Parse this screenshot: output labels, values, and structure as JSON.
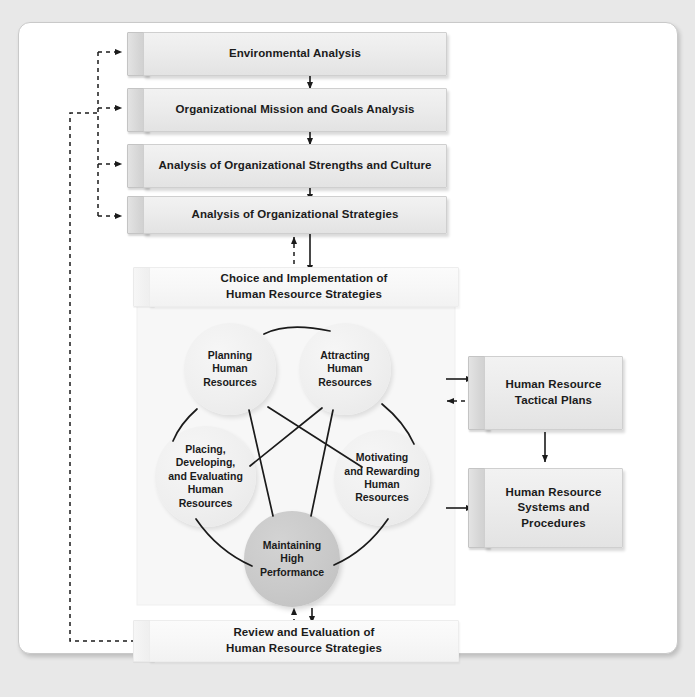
{
  "diagram": {
    "colors": {
      "page_background": "#e8e8e8",
      "canvas_background": "#ffffff",
      "box_face": "#ececec",
      "box_tab": "#d4d4d4",
      "panel_background": "#f7f7f7",
      "circle_light": "#efefef",
      "circle_dark": "#c9c9c9",
      "line": "#1b1b1b",
      "text": "#1b1b1b"
    }
  },
  "process_steps": [
    {
      "id": "environmental-analysis",
      "label": "Environmental Analysis"
    },
    {
      "id": "mission-goals-analysis",
      "label": "Organizational Mission and Goals Analysis"
    },
    {
      "id": "strengths-culture-analysis",
      "label": "Analysis of Organizational Strengths and Culture"
    },
    {
      "id": "strategies-analysis",
      "label": "Analysis of Organizational Strategies"
    }
  ],
  "choice_box": {
    "id": "choice-implementation",
    "line1": "Choice and Implementation of",
    "line2": "Human Resource Strategies"
  },
  "review_box": {
    "id": "review-evaluation",
    "line1": "Review and Evaluation of",
    "line2": "Human Resource Strategies"
  },
  "circles": [
    {
      "id": "planning-human-resources",
      "style": "light",
      "lines": [
        "Planning",
        "Human",
        "Resources"
      ]
    },
    {
      "id": "attracting-human-resources",
      "style": "light",
      "lines": [
        "Attracting",
        "Human",
        "Resources"
      ]
    },
    {
      "id": "placing-developing-evaluating-human-resources",
      "style": "light",
      "lines": [
        "Placing,",
        "Developing,",
        "and Evaluating",
        "Human",
        "Resources"
      ]
    },
    {
      "id": "motivating-rewarding-human-resources",
      "style": "light",
      "lines": [
        "Motivating",
        "and Rewarding",
        "Human",
        "Resources"
      ]
    },
    {
      "id": "maintaining-high-performance",
      "style": "dark",
      "lines": [
        "Maintaining",
        "High",
        "Performance"
      ]
    }
  ],
  "output_boxes": [
    {
      "id": "hr-tactical-plans",
      "line1": "Human Resource",
      "line2": "Tactical Plans",
      "line3": ""
    },
    {
      "id": "hr-systems-procedures",
      "line1": "Human Resource",
      "line2": "Systems and",
      "line3": "Procedures"
    }
  ],
  "connectors": {
    "solid_flow": "solid arrow",
    "feedback": "dashed feedback arrow"
  }
}
